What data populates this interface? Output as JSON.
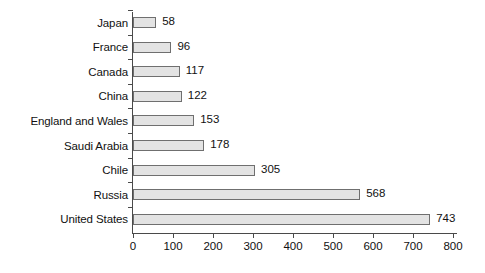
{
  "chart_data": {
    "type": "bar",
    "orientation": "horizontal",
    "title": "",
    "subtitle": "",
    "xlabel": "",
    "ylabel": "",
    "categories": [
      "Japan",
      "France",
      "Canada",
      "China",
      "England and Wales",
      "Saudi Arabia",
      "Chile",
      "Russia",
      "United States"
    ],
    "values": [
      58,
      96,
      117,
      122,
      153,
      178,
      305,
      568,
      743
    ],
    "data_labels": [
      "58",
      "96",
      "117",
      "122",
      "153",
      "178",
      "305",
      "568",
      "743"
    ],
    "xlim": [
      0,
      800
    ],
    "xticks": [
      0,
      100,
      200,
      300,
      400,
      500,
      600,
      700,
      800
    ],
    "xtick_labels": [
      "0",
      "100",
      "200",
      "300",
      "400",
      "500",
      "600",
      "700",
      "800"
    ],
    "grid": false,
    "legend": null,
    "legend_position": "none",
    "bar_fill_color": "#e3e3e3",
    "bar_border_color": "#6f6f6f",
    "axis_color": "#4a4a4a",
    "text_color": "#111111",
    "background_color": "#ffffff"
  }
}
